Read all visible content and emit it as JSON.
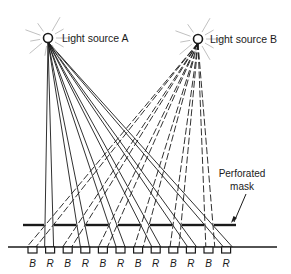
{
  "diagram": {
    "sources": [
      {
        "id": "A",
        "label": "Light source A",
        "x": 48,
        "y": 38,
        "ray_style": "solid"
      },
      {
        "id": "B",
        "label": "Light source B",
        "x": 198,
        "y": 39,
        "ray_style": "dashed"
      }
    ],
    "mask": {
      "label_line1": "Perforated",
      "label_line2": "mask",
      "y": 225,
      "x_start": 23,
      "x_end": 236,
      "gaps": [
        [
          44,
          54
        ],
        [
          76,
          86
        ],
        [
          108,
          118
        ],
        [
          140,
          150
        ],
        [
          172,
          182
        ],
        [
          204,
          214
        ]
      ]
    },
    "screen": {
      "y": 247,
      "x_start": 8,
      "x_end": 277
    },
    "phosphors": {
      "labels": [
        "B",
        "R",
        "B",
        "R",
        "B",
        "R",
        "B",
        "R",
        "B",
        "R",
        "B",
        "R"
      ],
      "first_x": 28,
      "spacing": 17.6,
      "width": 9,
      "height": 6
    },
    "colors": {
      "ink": "#1a1a1a",
      "background": "#ffffff"
    }
  }
}
